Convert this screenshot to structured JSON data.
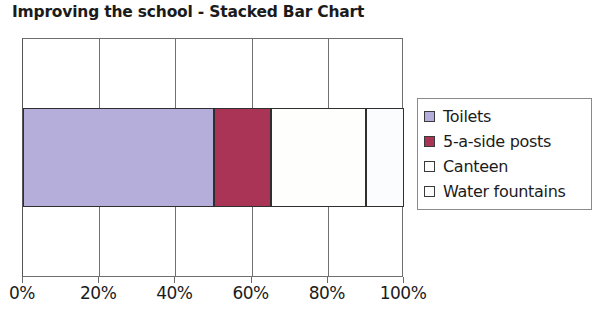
{
  "chart_data": {
    "type": "bar",
    "orientation": "horizontal",
    "stacked": true,
    "title": "Improving the school - Stacked Bar Chart",
    "xlabel": "",
    "ylabel": "",
    "xlim": [
      0,
      100
    ],
    "xticks": [
      0,
      20,
      40,
      60,
      80,
      100
    ],
    "xtick_labels": [
      "0%",
      "20%",
      "40%",
      "60%",
      "80%",
      "100%"
    ],
    "grid": true,
    "legend_position": "right",
    "categories": [
      ""
    ],
    "series": [
      {
        "name": "Toilets",
        "values": [
          50
        ],
        "color": "#b5aedb",
        "start": 0,
        "end": 50
      },
      {
        "name": "5-a-side posts",
        "values": [
          15
        ],
        "color": "#a93455",
        "start": 50,
        "end": 65
      },
      {
        "name": "Canteen",
        "values": [
          25
        ],
        "color": "#fefefc",
        "start": 65,
        "end": 90
      },
      {
        "name": "Water fountains",
        "values": [
          10
        ],
        "color": "#fbfcfd",
        "start": 90,
        "end": 100
      }
    ]
  },
  "legend": {
    "items": [
      {
        "label": "Toilets"
      },
      {
        "label": "5-a-side posts"
      },
      {
        "label": "Canteen"
      },
      {
        "label": "Water fountains"
      }
    ]
  }
}
